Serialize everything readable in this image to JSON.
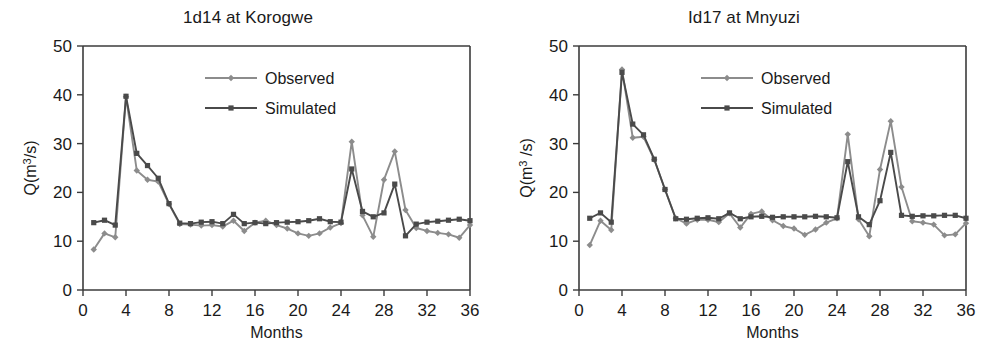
{
  "figure": {
    "panel_count": 2,
    "background": "#ffffff"
  },
  "colors": {
    "observed": "#8c8c8c",
    "simulated": "#4a4a4a",
    "axis": "#3b3b3b",
    "text": "#1a1a1a"
  },
  "chart_data": [
    {
      "type": "line",
      "title": "1d14 at Korogwe",
      "xlabel": "Months",
      "ylabel": "Q(m³/s)",
      "xlim": [
        0,
        36
      ],
      "ylim": [
        0,
        50
      ],
      "xticks": [
        0,
        4,
        8,
        12,
        16,
        20,
        24,
        28,
        32,
        36
      ],
      "yticks": [
        0,
        10,
        20,
        30,
        40,
        50
      ],
      "grid": false,
      "legend_position": "top-center",
      "legend": [
        "Observed",
        "Simulated"
      ],
      "x": [
        1,
        2,
        3,
        4,
        5,
        6,
        7,
        8,
        9,
        10,
        11,
        12,
        13,
        14,
        15,
        16,
        17,
        18,
        19,
        20,
        21,
        22,
        23,
        24,
        25,
        26,
        27,
        28,
        29,
        30,
        31,
        32,
        33,
        34,
        35,
        36
      ],
      "series": [
        {
          "name": "Observed",
          "marker": "diamond",
          "color": "#8c8c8c",
          "values": [
            8.3,
            11.6,
            10.8,
            39.6,
            24.5,
            22.6,
            22.2,
            17.6,
            13.5,
            13.4,
            13.2,
            13.3,
            13.0,
            14.2,
            12.1,
            13.8,
            14.2,
            13.3,
            12.6,
            11.6,
            11.1,
            11.6,
            12.8,
            13.7,
            30.4,
            15.3,
            10.9,
            22.6,
            28.4,
            16.4,
            12.7,
            12.1,
            11.7,
            11.4,
            10.7,
            13.3
          ]
        },
        {
          "name": "Simulated",
          "marker": "square",
          "color": "#4a4a4a",
          "values": [
            13.8,
            14.3,
            13.3,
            39.7,
            28.0,
            25.5,
            22.9,
            17.7,
            13.7,
            13.6,
            13.9,
            14.0,
            13.6,
            15.5,
            13.6,
            13.8,
            13.6,
            13.8,
            13.9,
            14.0,
            14.2,
            14.6,
            14.0,
            13.9,
            24.8,
            16.1,
            15.0,
            15.8,
            21.7,
            11.1,
            13.5,
            13.9,
            14.1,
            14.3,
            14.5,
            14.2
          ]
        }
      ]
    },
    {
      "type": "line",
      "title": "Id17 at Mnyuzi",
      "xlabel": "Months",
      "ylabel": "Q(m³ /s)",
      "xlim": [
        0,
        36
      ],
      "ylim": [
        0,
        50
      ],
      "xticks": [
        0,
        4,
        8,
        12,
        16,
        20,
        24,
        28,
        32,
        36
      ],
      "yticks": [
        0,
        10,
        20,
        30,
        40,
        50
      ],
      "grid": false,
      "legend_position": "top-center",
      "legend": [
        "Observed",
        "Simulated"
      ],
      "x": [
        1,
        2,
        3,
        4,
        5,
        6,
        7,
        8,
        9,
        10,
        11,
        12,
        13,
        14,
        15,
        16,
        17,
        18,
        19,
        20,
        21,
        22,
        23,
        24,
        25,
        26,
        27,
        28,
        29,
        30,
        31,
        32,
        33,
        34,
        35,
        36
      ],
      "series": [
        {
          "name": "Observed",
          "marker": "diamond",
          "color": "#8c8c8c",
          "values": [
            9.2,
            14.2,
            12.3,
            45.2,
            31.2,
            31.4,
            26.7,
            20.6,
            14.7,
            13.6,
            14.4,
            14.4,
            13.9,
            15.7,
            12.8,
            15.6,
            16.1,
            14.3,
            13.1,
            12.6,
            11.3,
            12.4,
            13.8,
            14.7,
            31.9,
            14.5,
            11.0,
            24.7,
            34.6,
            21.1,
            14.1,
            13.8,
            13.4,
            11.2,
            11.4,
            13.7
          ]
        },
        {
          "name": "Simulated",
          "marker": "square",
          "color": "#4a4a4a",
          "values": [
            14.7,
            15.8,
            13.9,
            44.6,
            34.0,
            31.8,
            26.8,
            20.6,
            14.6,
            14.5,
            14.7,
            14.8,
            14.6,
            15.8,
            14.6,
            15.0,
            15.1,
            14.9,
            15.0,
            15.0,
            15.0,
            15.1,
            15.0,
            14.8,
            26.3,
            15.0,
            13.4,
            18.3,
            28.2,
            15.3,
            15.1,
            15.2,
            15.2,
            15.3,
            15.3,
            14.7
          ]
        }
      ]
    }
  ]
}
